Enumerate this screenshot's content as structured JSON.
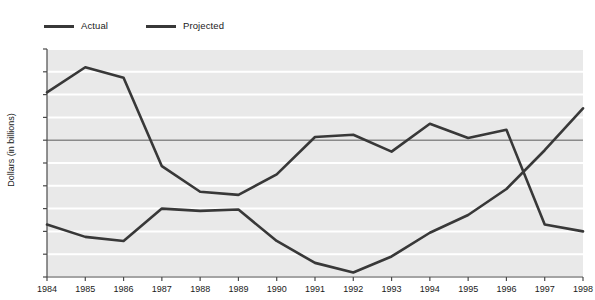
{
  "legend": {
    "position": "top-left",
    "entries": [
      {
        "label": "Actual",
        "color": "#383838"
      },
      {
        "label": "Projected",
        "color": "#383838"
      }
    ]
  },
  "axes": {
    "ylabel": "Dollars (in billions)",
    "xlabel": "",
    "yticks": [
      200,
      150,
      100,
      50,
      0,
      -50,
      -100,
      -150,
      -200,
      -250,
      -300
    ],
    "ytick_labels": [
      "200",
      "150",
      "100",
      "50",
      "0",
      "-50",
      "-100",
      "-150",
      "-200",
      "-250",
      "-300"
    ],
    "xtick_labels": [
      "1984",
      "1985",
      "1986",
      "1987",
      "1988",
      "1989",
      "1990",
      "1991",
      "1992",
      "1993",
      "1994",
      "1995",
      "1996",
      "1997",
      "1998"
    ]
  },
  "style": {
    "plot_background": "#e9e9e9",
    "gridline_color": "#ffffff",
    "zeroline_color": "#8a8a8a",
    "axis_color": "#4a4a4a",
    "line_color": "#383838"
  },
  "chart_data": {
    "type": "line",
    "title": "",
    "xlabel": "",
    "ylabel": "Dollars (in billions)",
    "categories": [
      1984,
      1985,
      1986,
      1987,
      1988,
      1989,
      1990,
      1991,
      1992,
      1993,
      1994,
      1995,
      1996,
      1997,
      1998
    ],
    "xlim": [
      1984,
      1998
    ],
    "ylim": [
      -300,
      200
    ],
    "grid": true,
    "legend_position": "top-left",
    "series": [
      {
        "name": "Actual",
        "color": "#383838",
        "values": [
          -185,
          -212,
          -221,
          -150,
          -155,
          -152,
          -221,
          -269,
          -290,
          -255,
          -203,
          -164,
          -107,
          -22,
          70
        ]
      },
      {
        "name": "Projected",
        "color": "#383838",
        "values": [
          105,
          160,
          137,
          -57,
          -113,
          -120,
          -75,
          7,
          12,
          -25,
          36,
          5,
          23,
          -185,
          -200
        ]
      }
    ]
  }
}
